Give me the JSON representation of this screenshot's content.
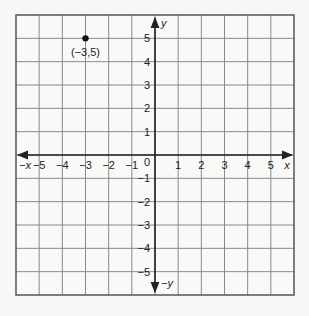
{
  "chart_data": {
    "type": "scatter",
    "title": "",
    "xlabel": "x",
    "ylabel": "y",
    "xlabel_negative": "-x",
    "ylabel_negative": "-y",
    "xlim": [
      -6,
      6
    ],
    "ylim": [
      -6,
      6
    ],
    "grid": true,
    "x_ticks": [
      "-5",
      "-4",
      "-3",
      "-2",
      "-1",
      "1",
      "2",
      "3",
      "4",
      "5"
    ],
    "y_ticks": [
      "5",
      "4",
      "3",
      "2",
      "1",
      "-1",
      "-2",
      "-3",
      "-4",
      "-5"
    ],
    "origin_label": "0",
    "points": [
      {
        "x": -3,
        "y": 5,
        "label": "(−3,5)"
      }
    ]
  }
}
